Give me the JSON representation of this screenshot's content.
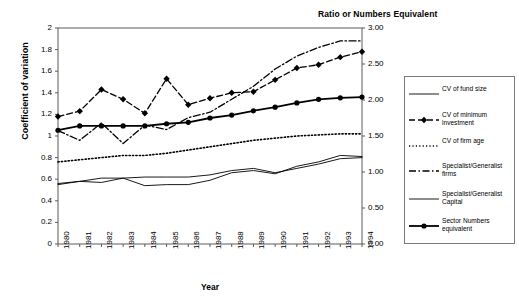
{
  "chart_data": {
    "type": "line",
    "title": "Ratio or Numbers Equivalent",
    "xlabel": "Year",
    "ylabel": "Coefficient of variation",
    "y2label": "Ratio or Numbers Equivalent",
    "grid": false,
    "legend_position": "right",
    "categories": [
      1980,
      1981,
      1982,
      1983,
      1984,
      1985,
      1986,
      1987,
      1988,
      1989,
      1990,
      1991,
      1992,
      1993,
      1994
    ],
    "xtick_labels": [
      "1980",
      "1981",
      "1982",
      "1983",
      "1984",
      "1985",
      "1986",
      "1987",
      "1988",
      "1989",
      "1990",
      "1991",
      "1992",
      "1993",
      "1994"
    ],
    "ylim": [
      0,
      2
    ],
    "ytick_labels": [
      "0",
      "0.2",
      "0.4",
      "0.6",
      "0.8",
      "1",
      "1.2",
      "1.4",
      "1.6",
      "1.8",
      "2"
    ],
    "yticks": [
      0,
      0.2,
      0.4,
      0.6,
      0.8,
      1,
      1.2,
      1.4,
      1.6,
      1.8,
      2
    ],
    "y2lim": [
      0,
      3
    ],
    "y2tick_labels": [
      "0.00",
      "0.50",
      "1.00",
      "1.50",
      "2.00",
      "2.50",
      "3.00"
    ],
    "y2ticks": [
      0,
      0.5,
      1.0,
      1.5,
      2.0,
      2.5,
      3.0
    ],
    "series": [
      {
        "name": "CV of fund size",
        "axis": "left",
        "style": "solid-thin",
        "marker": "none",
        "values": [
          0.56,
          0.58,
          0.61,
          0.61,
          0.62,
          0.62,
          0.62,
          0.64,
          0.68,
          0.7,
          0.66,
          0.7,
          0.74,
          0.79,
          0.8
        ]
      },
      {
        "name": "CV of minimum investment",
        "axis": "left",
        "style": "dashed",
        "marker": "diamond",
        "values": [
          1.18,
          1.23,
          1.43,
          1.34,
          1.21,
          1.53,
          1.29,
          1.35,
          1.4,
          1.41,
          1.52,
          1.63,
          1.66,
          1.73,
          1.78
        ]
      },
      {
        "name": "CV of firm age",
        "axis": "left",
        "style": "dotted",
        "marker": "none",
        "values": [
          0.76,
          0.78,
          0.8,
          0.82,
          0.82,
          0.84,
          0.87,
          0.9,
          0.93,
          0.96,
          0.98,
          1.0,
          1.01,
          1.02,
          1.02
        ]
      },
      {
        "name": "Specialist/Generalist firms",
        "axis": "left",
        "style": "dash-dot",
        "marker": "none",
        "values": [
          1.05,
          0.96,
          1.12,
          0.93,
          1.1,
          1.06,
          1.17,
          1.22,
          1.34,
          1.46,
          1.62,
          1.74,
          1.82,
          1.88,
          1.88
        ]
      },
      {
        "name": "Specialist/Generalist Capital",
        "axis": "left",
        "style": "solid-thin",
        "marker": "none",
        "values": [
          0.55,
          0.58,
          0.57,
          0.61,
          0.54,
          0.55,
          0.55,
          0.59,
          0.66,
          0.68,
          0.65,
          0.72,
          0.76,
          0.82,
          0.81
        ]
      },
      {
        "name": "Sector Numbers equivalent",
        "axis": "right",
        "style": "solid-bold",
        "marker": "circle",
        "values": [
          1.58,
          1.64,
          1.64,
          1.64,
          1.64,
          1.67,
          1.69,
          1.75,
          1.79,
          1.85,
          1.9,
          1.96,
          2.01,
          2.03,
          2.04
        ]
      }
    ]
  },
  "legend": {
    "entries": [
      {
        "label": "CV of fund size",
        "key": "solid-thin"
      },
      {
        "label": "CV of minimum investment",
        "key": "dashed-diamond"
      },
      {
        "label": "CV of firm age",
        "key": "dotted"
      },
      {
        "label": "Specialist/Generalist firms",
        "key": "dash-dot"
      },
      {
        "label": "Specialist/Generalist Capital",
        "key": "solid-thin"
      },
      {
        "label": "Sector Numbers equivalent",
        "key": "solid-circle"
      }
    ]
  }
}
